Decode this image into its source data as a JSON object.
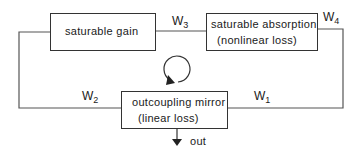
{
  "diagram": {
    "type": "laser cavity loop diagram",
    "blocks": {
      "gain": {
        "line1": "saturable gain"
      },
      "absorber": {
        "line1": "saturable absorption",
        "line2": "(nonlinear loss)"
      },
      "mirror": {
        "line1": "outcoupling mirror",
        "line2": "(linear loss)"
      }
    },
    "labels": {
      "w1": {
        "base": "W",
        "sub": "1"
      },
      "w2": {
        "base": "W",
        "sub": "2"
      },
      "w3": {
        "base": "W",
        "sub": "3"
      },
      "w4": {
        "base": "W",
        "sub": "4"
      }
    },
    "output_label": "out",
    "circulation_icon": "clockwise-loop-arrow",
    "line_color": "#333333"
  }
}
